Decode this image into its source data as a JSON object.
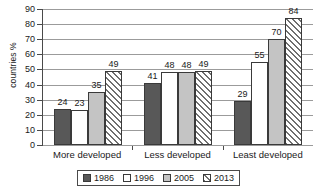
{
  "chart_data": {
    "type": "bar",
    "title": "",
    "xlabel": "",
    "ylabel": "countries %",
    "ylim": [
      0,
      90
    ],
    "ytick_step": 10,
    "yticks": [
      0,
      10,
      20,
      30,
      40,
      50,
      60,
      70,
      80,
      90
    ],
    "grid": true,
    "legend_position": "bottom",
    "categories": [
      "More developed",
      "Less developed",
      "Least developed"
    ],
    "series": [
      {
        "name": "1986",
        "values": [
          24,
          41,
          29
        ],
        "fill": "solid-dark",
        "color": "#585858"
      },
      {
        "name": "1996",
        "values": [
          23,
          48,
          55
        ],
        "fill": "dotted-white",
        "color": "#ffffff"
      },
      {
        "name": "2005",
        "values": [
          35,
          48,
          70
        ],
        "fill": "solid-light",
        "color": "#c4c4c4"
      },
      {
        "name": "2013",
        "values": [
          49,
          49,
          84
        ],
        "fill": "diagonal-hatch",
        "color": "#ffffff"
      }
    ]
  },
  "legend": {
    "items": [
      {
        "label": "1986"
      },
      {
        "label": "1996"
      },
      {
        "label": "2005"
      },
      {
        "label": "2013"
      }
    ]
  }
}
